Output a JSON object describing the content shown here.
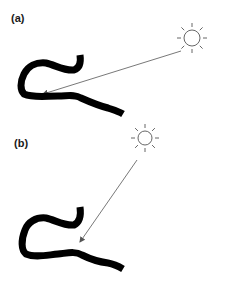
{
  "panels": [
    {
      "label": "(a)",
      "sun": {
        "cx": 192,
        "cy": 38,
        "r": 8
      },
      "arrow": {
        "x1": 181,
        "y1": 51,
        "x2": 43,
        "y2": 94
      },
      "worm_path": "M80,55 C81,62 80,68 74,70 C64,71 55,65 46,63 C36,62 28,66 24,74 C20,82 20,90 24,94 C33,98 45,96 58,96 C68,96 74,94 81,98 C90,102 100,106 108,108 C114,110 118,111 123,114"
    },
    {
      "label": "(b)",
      "sun": {
        "cx": 145,
        "cy": 138,
        "r": 7
      },
      "arrow": {
        "x1": 137,
        "y1": 160,
        "x2": 80,
        "y2": 242
      },
      "worm_path": "M80,207 C81,214 80,222 74,225 C64,226 55,220 46,218 C36,217 28,222 25,230 C21,240 21,250 26,254 C35,258 47,255 58,254 C68,253 75,251 82,255 C90,259 100,262 108,263 C114,264 118,266 123,269"
    }
  ],
  "colors": {
    "worm": "#000000",
    "sun": "#555555",
    "arrow": "#555555"
  }
}
